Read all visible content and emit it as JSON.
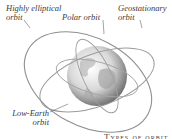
{
  "diagram": {
    "labels": {
      "highly_elliptical": "Highly elliptical orbit",
      "highly_elliptical_line1": "Highly elliptical",
      "highly_elliptical_line2": "orbit",
      "polar": "Polar orbit",
      "geostationary_line1": "Geostationary",
      "geostationary_line2": "orbit",
      "low_earth_line1": "Low-Earth",
      "low_earth_line2": "orbit"
    },
    "caption": "Types of orbit",
    "colors": {
      "orbit_line": "#8a8a8a",
      "globe_light": "#f2f2f2",
      "globe_dark": "#7a7a7a",
      "label_text": "#3a3a3a"
    }
  }
}
